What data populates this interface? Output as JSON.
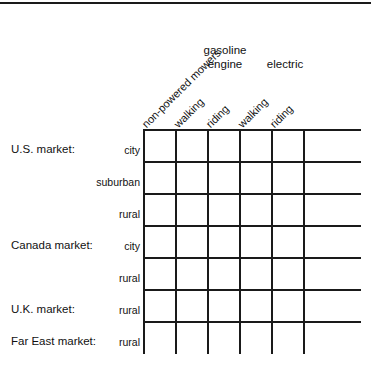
{
  "figure": {
    "type": "blank-data-matrix-table",
    "top_rule": true
  },
  "column_groups": [
    {
      "label": "gasoline\nengine",
      "line1": "gasoline",
      "line2": "engine"
    },
    {
      "label": "electric",
      "line1": "electric",
      "line2": ""
    }
  ],
  "columns": [
    {
      "label": "non-powered mowers",
      "group": ""
    },
    {
      "label": "walking",
      "group": "gasoline engine"
    },
    {
      "label": "riding",
      "group": "gasoline engine"
    },
    {
      "label": "walking",
      "group": "electric"
    },
    {
      "label": "riding",
      "group": "electric"
    },
    {
      "label": "",
      "group": ""
    }
  ],
  "rows": [
    {
      "market": "U.S. market:",
      "segment": "city"
    },
    {
      "market": "",
      "segment": "suburban"
    },
    {
      "market": "",
      "segment": "rural"
    },
    {
      "market": "Canada market:",
      "segment": "city"
    },
    {
      "market": "",
      "segment": "rural"
    },
    {
      "market": "U.K. market:",
      "segment": "rural"
    },
    {
      "market": "Far East market:",
      "segment": "rural"
    }
  ],
  "cells": [
    [
      "",
      "",
      "",
      "",
      "",
      ""
    ],
    [
      "",
      "",
      "",
      "",
      "",
      ""
    ],
    [
      "",
      "",
      "",
      "",
      "",
      ""
    ],
    [
      "",
      "",
      "",
      "",
      "",
      ""
    ],
    [
      "",
      "",
      "",
      "",
      "",
      ""
    ],
    [
      "",
      "",
      "",
      "",
      "",
      ""
    ],
    [
      "",
      "",
      "",
      "",
      "",
      ""
    ]
  ],
  "colors": {
    "line": "#1a1a1a",
    "text": "#111111",
    "background": "#ffffff"
  }
}
